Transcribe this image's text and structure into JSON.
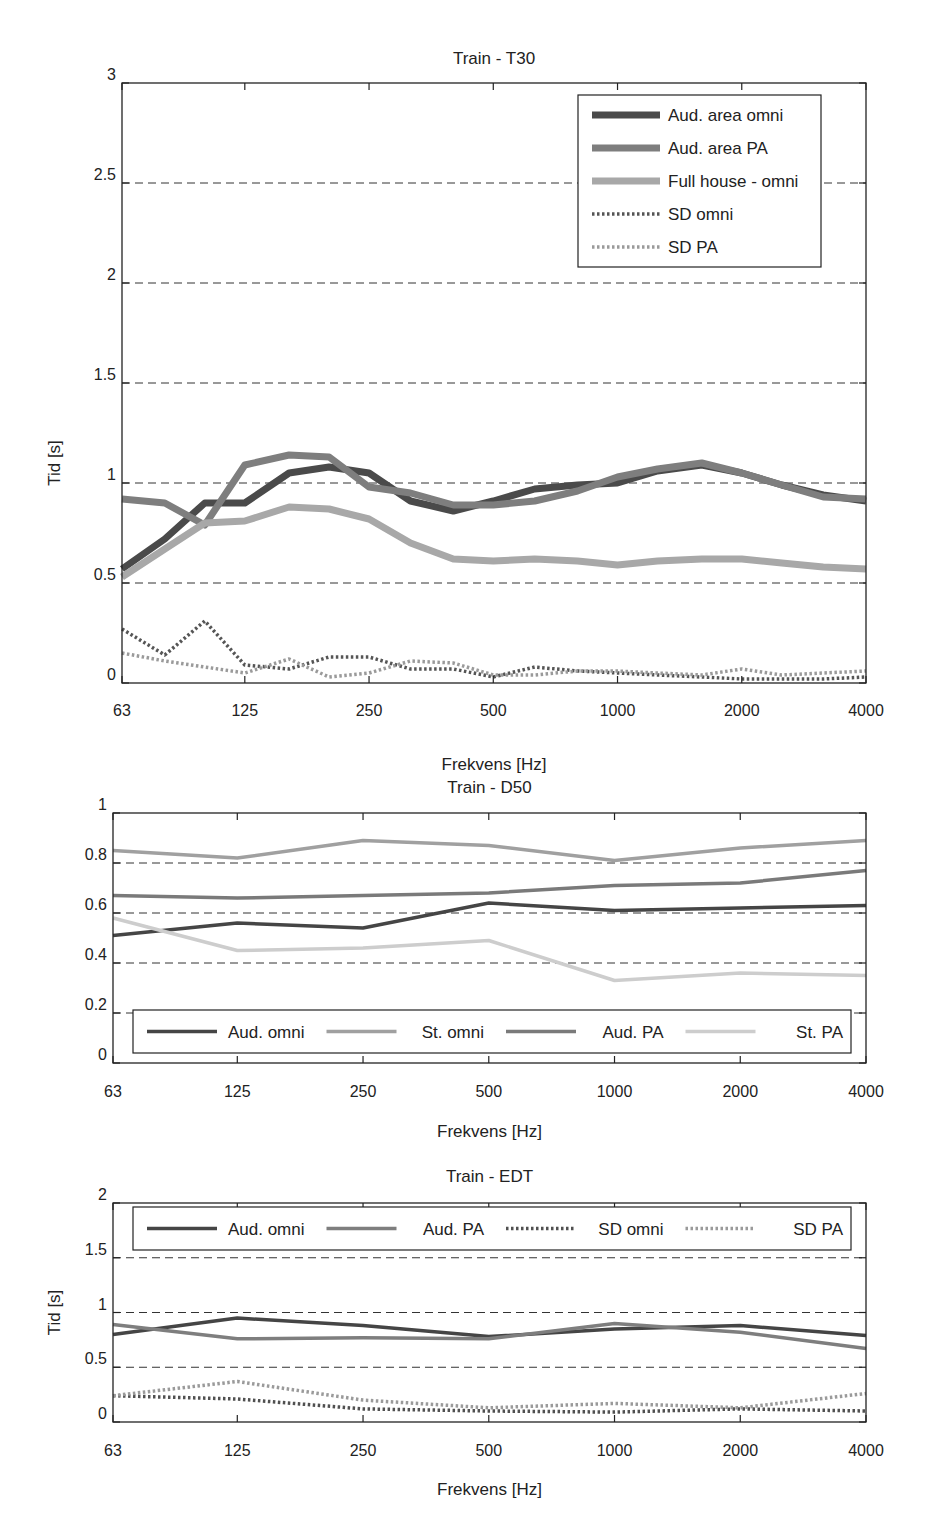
{
  "chart_data": [
    {
      "type": "line",
      "title": "Train - T30",
      "xlabel": "Frekvens [Hz]",
      "ylabel": "Tid [s]",
      "ylim": [
        0,
        3
      ],
      "yticks": [
        0,
        0.5,
        1,
        1.5,
        2,
        2.5,
        3
      ],
      "ytick_labels": [
        "0",
        "0.5",
        "1",
        "1.5",
        "2",
        "2.5",
        "3"
      ],
      "xtick_labels": [
        "63",
        "125",
        "250",
        "500",
        "1000",
        "2000",
        "4000"
      ],
      "grid": "dashed horizontal at 0.5 intervals",
      "legend_position": "upper right",
      "x": [
        63,
        80,
        100,
        125,
        160,
        200,
        250,
        315,
        400,
        500,
        630,
        800,
        1000,
        1250,
        1600,
        2000,
        2500,
        3150,
        4000
      ],
      "series": [
        {
          "name": "Aud. area omni",
          "style": "solid-thick",
          "color": "#4a4a4a",
          "values": [
            0.57,
            0.72,
            0.9,
            0.9,
            1.05,
            1.08,
            1.05,
            0.91,
            0.86,
            0.91,
            0.97,
            0.99,
            1.0,
            1.06,
            1.09,
            1.05,
            0.99,
            0.94,
            0.91
          ]
        },
        {
          "name": "Aud. area PA",
          "style": "solid-thick",
          "color": "#7e7e7e",
          "values": [
            0.92,
            0.9,
            0.79,
            1.09,
            1.14,
            1.13,
            0.98,
            0.95,
            0.89,
            0.89,
            0.91,
            0.96,
            1.03,
            1.07,
            1.1,
            1.05,
            0.99,
            0.93,
            0.92
          ]
        },
        {
          "name": "Full house - omni",
          "style": "solid-thick",
          "color": "#a8a8a8",
          "values": [
            0.53,
            0.67,
            0.8,
            0.81,
            0.88,
            0.87,
            0.82,
            0.7,
            0.62,
            0.61,
            0.62,
            0.61,
            0.59,
            0.61,
            0.62,
            0.62,
            0.6,
            0.58,
            0.57
          ]
        },
        {
          "name": "SD omni",
          "style": "dotted",
          "color": "#555555",
          "values": [
            0.27,
            0.14,
            0.31,
            0.09,
            0.07,
            0.13,
            0.13,
            0.07,
            0.07,
            0.03,
            0.08,
            0.06,
            0.05,
            0.04,
            0.03,
            0.02,
            0.02,
            0.02,
            0.03
          ]
        },
        {
          "name": "SD PA",
          "style": "dotted",
          "color": "#9a9a9a",
          "values": [
            0.15,
            0.11,
            0.08,
            0.05,
            0.12,
            0.03,
            0.05,
            0.11,
            0.1,
            0.04,
            0.04,
            0.06,
            0.06,
            0.05,
            0.04,
            0.07,
            0.04,
            0.05,
            0.06
          ]
        }
      ]
    },
    {
      "type": "line",
      "title": "Train - D50",
      "xlabel": "Frekvens [Hz]",
      "ylabel": "",
      "ylim": [
        0,
        1
      ],
      "yticks": [
        0,
        0.2,
        0.4,
        0.6,
        0.8,
        1
      ],
      "ytick_labels": [
        "0",
        "0.2",
        "0.4",
        "0.6",
        "0.8",
        "1"
      ],
      "xtick_labels": [
        "63",
        "125",
        "250",
        "500",
        "1000",
        "2000",
        "4000"
      ],
      "grid": "dashed horizontal at 0.2 intervals",
      "legend_position": "lower, single row",
      "x": [
        63,
        125,
        250,
        500,
        1000,
        2000,
        4000
      ],
      "series": [
        {
          "name": "Aud. omni",
          "style": "solid",
          "color": "#454545",
          "values": [
            0.51,
            0.56,
            0.54,
            0.64,
            0.61,
            0.62,
            0.63
          ]
        },
        {
          "name": "St. omni",
          "style": "solid",
          "color": "#a0a0a0",
          "values": [
            0.85,
            0.82,
            0.89,
            0.87,
            0.81,
            0.86,
            0.89
          ]
        },
        {
          "name": "Aud. PA",
          "style": "solid",
          "color": "#7a7a7a",
          "values": [
            0.67,
            0.66,
            0.67,
            0.68,
            0.71,
            0.72,
            0.77
          ]
        },
        {
          "name": "St. PA",
          "style": "solid",
          "color": "#cdcdcd",
          "values": [
            0.58,
            0.45,
            0.46,
            0.49,
            0.33,
            0.36,
            0.35
          ]
        }
      ]
    },
    {
      "type": "line",
      "title": "Train - EDT",
      "xlabel": "Frekvens [Hz]",
      "ylabel": "Tid [s]",
      "ylim": [
        0,
        2
      ],
      "yticks": [
        0,
        0.5,
        1,
        1.5,
        2
      ],
      "ytick_labels": [
        "0",
        "0.5",
        "1",
        "1.5",
        "2"
      ],
      "xtick_labels": [
        "63",
        "125",
        "250",
        "500",
        "1000",
        "2000",
        "4000"
      ],
      "grid": "dashed horizontal at 0.5 intervals",
      "legend_position": "upper, single row",
      "x": [
        63,
        125,
        250,
        500,
        1000,
        2000,
        4000
      ],
      "series": [
        {
          "name": "Aud. omni",
          "style": "solid",
          "color": "#454545",
          "values": [
            0.8,
            0.95,
            0.88,
            0.78,
            0.85,
            0.88,
            0.79
          ]
        },
        {
          "name": "Aud. PA",
          "style": "solid",
          "color": "#7e7e7e",
          "values": [
            0.89,
            0.76,
            0.77,
            0.76,
            0.9,
            0.82,
            0.67
          ]
        },
        {
          "name": "SD omni",
          "style": "dotted",
          "color": "#505050",
          "values": [
            0.24,
            0.21,
            0.12,
            0.1,
            0.09,
            0.12,
            0.1
          ]
        },
        {
          "name": "SD PA",
          "style": "dotted",
          "color": "#9a9a9a",
          "values": [
            0.24,
            0.37,
            0.2,
            0.13,
            0.17,
            0.13,
            0.26
          ]
        }
      ]
    }
  ]
}
